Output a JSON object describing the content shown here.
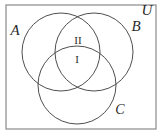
{
  "diagram": {
    "type": "venn-3-set",
    "title": "",
    "universe": {
      "label": "U",
      "border_color": "#8a8a8a",
      "fill_color": "#ffffff",
      "x": 6,
      "y": 5,
      "width": 150,
      "height": 124
    },
    "stroke_color": "#3a3a3a",
    "text_color": "#2b2b2b",
    "sets": [
      {
        "id": "A",
        "label": "A",
        "cx": 61,
        "cy": 52,
        "r": 39,
        "label_x": 15,
        "label_y": 35
      },
      {
        "id": "B",
        "label": "B",
        "cx": 94,
        "cy": 52,
        "r": 39,
        "label_x": 134,
        "label_y": 31
      },
      {
        "id": "C",
        "label": "C",
        "cx": 77,
        "cy": 85,
        "r": 39,
        "label_x": 116,
        "label_y": 114
      }
    ],
    "universe_label": {
      "text": "U",
      "x": 143,
      "y": 14
    },
    "regions": [
      {
        "id": "region-II",
        "label": "II",
        "description": "A intersect B, outside C",
        "x": 77,
        "y": 42
      },
      {
        "id": "region-I",
        "label": "I",
        "description": "A intersect B intersect C",
        "x": 77,
        "y": 62
      }
    ]
  }
}
